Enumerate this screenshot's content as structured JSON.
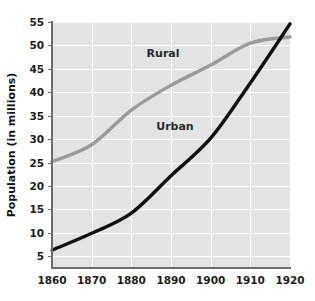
{
  "chart_data": {
    "type": "line",
    "title": "",
    "subtitle": "",
    "xlabel": "",
    "ylabel": "Population (in millions)",
    "x": [
      1860,
      1870,
      1880,
      1890,
      1900,
      1910,
      1920
    ],
    "xticklabels": [
      "1860",
      "1870",
      "1880",
      "1890",
      "1900",
      "1910",
      "1920"
    ],
    "yticks": [
      5,
      10,
      15,
      20,
      25,
      30,
      35,
      40,
      45,
      50,
      55
    ],
    "yticklabels": [
      "5",
      "10",
      "15",
      "20",
      "25",
      "30",
      "35",
      "40",
      "45",
      "50",
      "55"
    ],
    "xlim": [
      1860,
      1920
    ],
    "ylim": [
      2.5,
      55
    ],
    "grid": true,
    "legend_position": "inline-annotation",
    "series": [
      {
        "name": "Rural",
        "color": "#9a9a9a",
        "line_width": 3.4,
        "values": [
          25.2,
          28.8,
          36.2,
          41.5,
          45.8,
          50.5,
          51.8
        ],
        "label_text": "Rural",
        "label_x": 1888,
        "label_y": 47.5
      },
      {
        "name": "Urban",
        "color": "#111111",
        "line_width": 3.4,
        "values": [
          6.3,
          9.9,
          14.2,
          22.2,
          30.2,
          42.0,
          54.6
        ],
        "label_text": "Urban",
        "label_x": 1891,
        "label_y": 32.0
      }
    ],
    "annotations": [
      {
        "text": "Rural",
        "series": "Rural"
      },
      {
        "text": "Urban",
        "series": "Urban"
      }
    ],
    "colors": {
      "plot_background": "#e3e3e3",
      "page_background": "#ffffff",
      "gridline": "#ffffff",
      "axis": "#6d6d6d",
      "tick_text": "#1c1c1c",
      "axis_title": "#111111",
      "rural": "#9a9a9a",
      "urban": "#111111"
    }
  },
  "axis": {
    "y_title": "Population (in millions)"
  }
}
